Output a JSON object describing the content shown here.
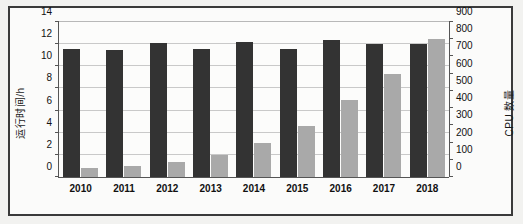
{
  "chart_data": {
    "type": "bar",
    "title": "",
    "xlabel": "",
    "categories": [
      "2010",
      "2011",
      "2012",
      "2013",
      "2014",
      "2015",
      "2016",
      "2017",
      "2018"
    ],
    "series": [
      {
        "name": "运行时间/h",
        "axis": "left",
        "color": "#333333",
        "values": [
          11.6,
          11.5,
          12.1,
          11.6,
          12.2,
          11.6,
          12.4,
          12.0,
          12.0
        ]
      },
      {
        "name": "CPU 数量",
        "axis": "right",
        "color": "#a9a9a9",
        "values": [
          50,
          62,
          90,
          125,
          200,
          295,
          450,
          598,
          800
        ]
      }
    ],
    "y_left": {
      "label": "运行时间/h",
      "ticks": [
        0,
        2,
        4,
        6,
        8,
        10,
        12,
        14
      ],
      "ylim": [
        0,
        14
      ]
    },
    "y_right": {
      "label": "CPU 数量",
      "ticks": [
        0,
        100,
        200,
        300,
        400,
        500,
        600,
        700,
        800,
        900
      ],
      "ylim": [
        0,
        900
      ]
    },
    "grid": true,
    "legend": "none"
  }
}
